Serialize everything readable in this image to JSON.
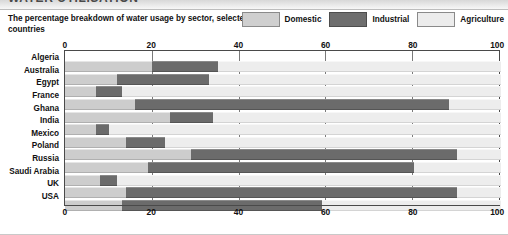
{
  "header": {
    "title": "WATER UTILISATION",
    "subtitle": "The percentage breakdown of water usage by sector, selected countries"
  },
  "legend": {
    "items": [
      {
        "label": "Domestic",
        "color": "#cdcdcd",
        "icon": "legend-swatch"
      },
      {
        "label": "Industrial",
        "color": "#6b6b6b",
        "icon": "legend-swatch"
      },
      {
        "label": "Agriculture",
        "color": "#ededed",
        "icon": "legend-swatch"
      }
    ]
  },
  "chart_data": {
    "type": "bar",
    "orientation": "horizontal",
    "stacked": true,
    "title": "WATER UTILISATION",
    "subtitle": "The percentage breakdown of water usage by sector, selected countries",
    "xlabel": "",
    "ylabel": "",
    "xlim": [
      0,
      100
    ],
    "ticks": [
      0,
      20,
      40,
      60,
      80,
      100
    ],
    "tick_labels": [
      "0",
      "20",
      "40",
      "60",
      "80",
      "100"
    ],
    "grid": true,
    "legend_position": "top-right",
    "categories": [
      "Algeria",
      "Australia",
      "Egypt",
      "France",
      "Ghana",
      "India",
      "Mexico",
      "Poland",
      "Russia",
      "Saudi Arabia",
      "UK",
      "USA"
    ],
    "series": [
      {
        "name": "Domestic",
        "color": "#cdcdcd",
        "values": [
          20,
          12,
          7,
          16,
          24,
          7,
          14,
          29,
          19,
          8,
          14,
          13
        ]
      },
      {
        "name": "Industrial",
        "color": "#6b6b6b",
        "values": [
          15,
          21,
          6,
          72,
          10,
          3,
          9,
          61,
          61,
          4,
          76,
          46
        ]
      },
      {
        "name": "Agriculture",
        "color": "#ededed",
        "values": [
          65,
          67,
          87,
          12,
          66,
          90,
          77,
          10,
          20,
          88,
          10,
          41
        ]
      }
    ]
  }
}
